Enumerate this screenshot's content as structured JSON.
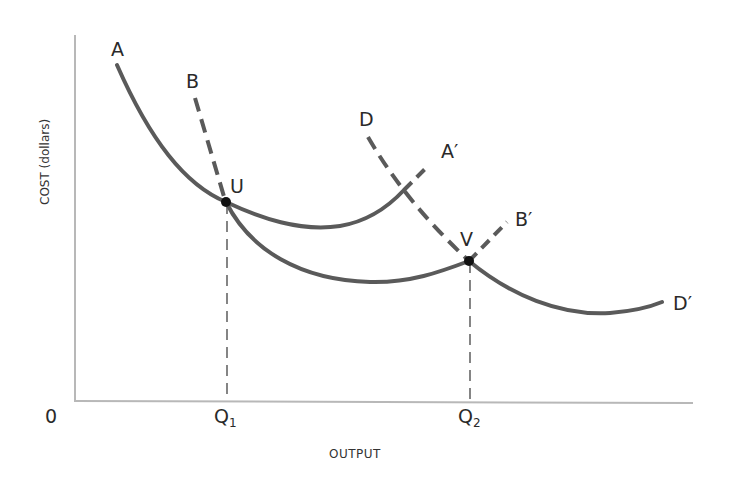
{
  "diagram": {
    "type": "cost-curves",
    "axes": {
      "x_label": "OUTPUT",
      "y_label": "COST (dollars)",
      "origin_label": "0",
      "x_ticks": [
        {
          "label": "Q",
          "sub": "1"
        },
        {
          "label": "Q",
          "sub": "2"
        }
      ]
    },
    "curves": [
      {
        "start_label": "A",
        "end_label": "A′",
        "style": "solid then dashed"
      },
      {
        "start_label": "B",
        "end_label": "B′",
        "style": "dashed, solid, dashed"
      },
      {
        "start_label": "D",
        "end_label": "D′",
        "style": "dashed then solid"
      }
    ],
    "points": [
      {
        "label": "U"
      },
      {
        "label": "V"
      }
    ],
    "colors": {
      "curve": "#5a5a5a",
      "axis": "#b5b5b5",
      "point": "#111111",
      "text": "#2a2a2a"
    }
  }
}
